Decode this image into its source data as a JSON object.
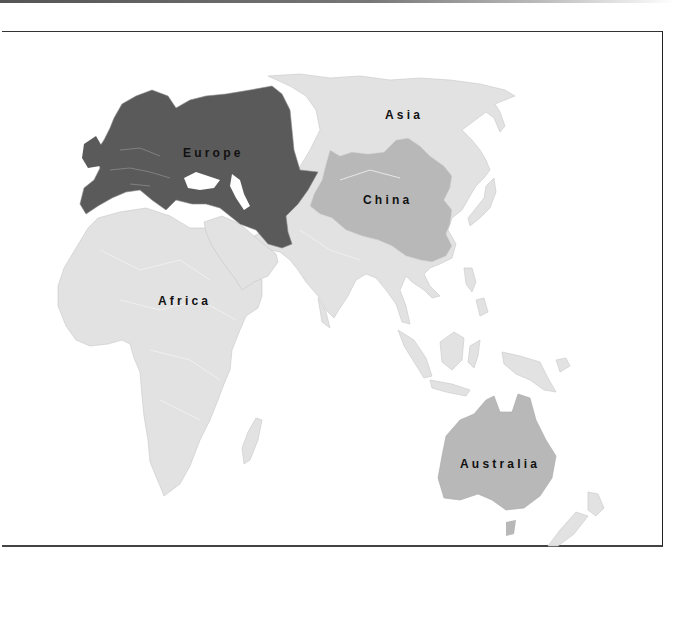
{
  "map": {
    "colors": {
      "background": "#ffffff",
      "frame": "#333333",
      "europe": "#5a5a5a",
      "china": "#b8b8b8",
      "australia": "#b8b8b8",
      "other_land": "#e2e2e2",
      "borders": "#f5f5f5",
      "label_text": "#111111"
    },
    "regions": [
      {
        "id": "europe",
        "label": "Europe",
        "highlight": "dark"
      },
      {
        "id": "asia",
        "label": "Asia",
        "highlight": "none"
      },
      {
        "id": "china",
        "label": "China",
        "highlight": "medium"
      },
      {
        "id": "africa",
        "label": "Africa",
        "highlight": "none"
      },
      {
        "id": "australia",
        "label": "Australia",
        "highlight": "medium"
      }
    ]
  }
}
